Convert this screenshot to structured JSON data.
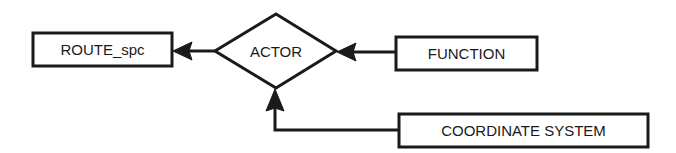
{
  "diagram": {
    "type": "entity-relationship",
    "nodes": {
      "route_spc": {
        "label": "ROUTE_spc",
        "shape": "rectangle"
      },
      "actor": {
        "label": "ACTOR",
        "shape": "diamond"
      },
      "function": {
        "label": "FUNCTION",
        "shape": "rectangle"
      },
      "coordinate_system": {
        "label": "COORDINATE SYSTEM",
        "shape": "rectangle"
      }
    },
    "edges": [
      {
        "from": "ACTOR",
        "to": "ROUTE_spc",
        "arrow": "filled-triangle"
      },
      {
        "from": "FUNCTION",
        "to": "ACTOR",
        "arrow": "filled-triangle"
      },
      {
        "from": "COORDINATE SYSTEM",
        "to": "ACTOR",
        "arrow": "filled-triangle"
      }
    ],
    "colors": {
      "stroke": "#1a1a1a",
      "background": "#ffffff"
    }
  }
}
